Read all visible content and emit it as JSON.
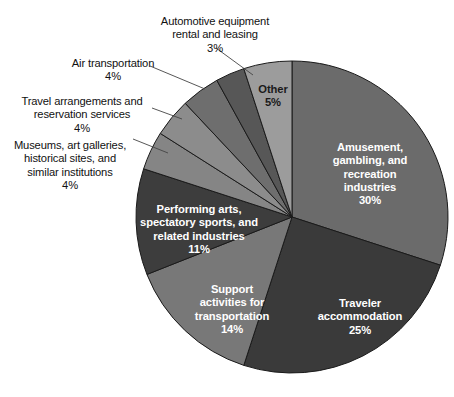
{
  "chart_data": {
    "type": "pie",
    "title": "",
    "subtitle": "",
    "xlabel": "",
    "ylabel": "",
    "legend_position": "none",
    "grid": false,
    "unit": "%",
    "total": 100,
    "start_angle_deg": 0,
    "direction": "clockwise",
    "categories": [
      "Amusement, gambling, and recreation industries",
      "Traveler accommodation",
      "Support activities for transportation",
      "Performing arts, spectatory sports, and related industries",
      "Museums, art galleries, historical sites, and similar institutions",
      "Travel arrangements and reservation services",
      "Air transportation",
      "Automotive equipment rental and leasing",
      "Other"
    ],
    "values": [
      30,
      25,
      14,
      11,
      4,
      4,
      4,
      3,
      5
    ],
    "colors": [
      "#6b6b6b",
      "#3a3a3a",
      "#787878",
      "#3d3d3d",
      "#858585",
      "#8c8c8c",
      "#6e6e6e",
      "#575757",
      "#9c9c9c"
    ],
    "slices": [
      {
        "name": "amusement-gambling-recreation",
        "label": "Amusement,\ngambling, and\nrecreation\nindustries",
        "percent_text": "30%",
        "value": 30,
        "color": "#6b6b6b",
        "label_placement": "inside",
        "label_color": "light"
      },
      {
        "name": "traveler-accommodation",
        "label": "Traveler\naccommodation",
        "percent_text": "25%",
        "value": 25,
        "color": "#3a3a3a",
        "label_placement": "inside",
        "label_color": "light"
      },
      {
        "name": "support-activities-transportation",
        "label": "Support\nactivities for\ntransportation",
        "percent_text": "14%",
        "value": 14,
        "color": "#787878",
        "label_placement": "inside",
        "label_color": "light"
      },
      {
        "name": "performing-arts-spectatory-sports",
        "label": "Performing arts,\nspectatory sports, and\nrelated industries",
        "percent_text": "11%",
        "value": 11,
        "color": "#3d3d3d",
        "label_placement": "inside",
        "label_color": "light"
      },
      {
        "name": "museums-art-galleries",
        "label": "Museums, art galleries,\nhistorical sites, and\nsimilar institutions",
        "percent_text": "4%",
        "value": 4,
        "color": "#858585",
        "label_placement": "outside",
        "label_color": "dark"
      },
      {
        "name": "travel-arrangements-reservation",
        "label": "Travel arrangements and\nreservation services",
        "percent_text": "4%",
        "value": 4,
        "color": "#8c8c8c",
        "label_placement": "outside",
        "label_color": "dark"
      },
      {
        "name": "air-transportation",
        "label": "Air transportation",
        "percent_text": "4%",
        "value": 4,
        "color": "#6e6e6e",
        "label_placement": "outside",
        "label_color": "dark"
      },
      {
        "name": "automotive-equipment-rental-leasing",
        "label": "Automotive equipment\nrental and leasing",
        "percent_text": "3%",
        "value": 3,
        "color": "#575757",
        "label_placement": "outside",
        "label_color": "dark"
      },
      {
        "name": "other",
        "label": "Other",
        "percent_text": "5%",
        "value": 5,
        "color": "#9c9c9c",
        "label_placement": "inside",
        "label_color": "dark"
      }
    ],
    "geometry": {
      "center_x": 292,
      "center_y": 217,
      "radius": 156,
      "stroke_color": "#1a1a1a",
      "stroke_width": 1
    },
    "leader_lines": [
      {
        "name": "leader-automotive",
        "x1": 216,
        "y1": 48,
        "x2": 253,
        "y2": 75
      },
      {
        "name": "leader-air",
        "x1": 150,
        "y1": 66,
        "x2": 205,
        "y2": 89
      },
      {
        "name": "leader-travel",
        "x1": 152,
        "y1": 108,
        "x2": 182,
        "y2": 119
      },
      {
        "name": "leader-museums",
        "x1": 133,
        "y1": 139,
        "x2": 168,
        "y2": 153
      }
    ]
  }
}
